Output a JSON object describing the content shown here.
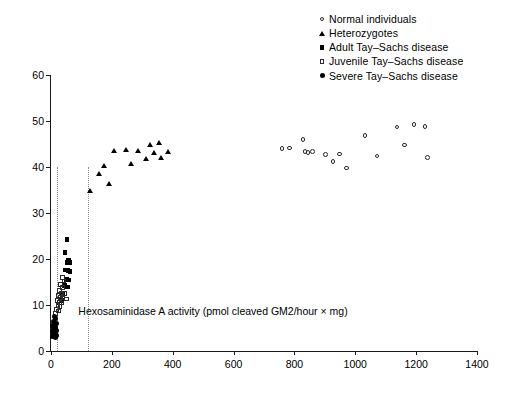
{
  "chart_data": {
    "type": "scatter",
    "title": "",
    "xlabel": "Hexosaminidase A activity (pmol cleaved GM2/hour × mg)",
    "ylabel": "Turnover (% of incorporated GM2)",
    "xlim": [
      0,
      1400
    ],
    "ylim": [
      0,
      60
    ],
    "xticks": [
      0,
      200,
      400,
      600,
      800,
      1000,
      1200,
      1400
    ],
    "yticks": [
      0,
      10,
      20,
      30,
      40,
      50,
      60
    ],
    "grid": false,
    "legend_position": "top-right",
    "reference_lines": [
      {
        "type": "vertical",
        "x": 20,
        "y_from": 0,
        "y_to": 40,
        "style": "dotted",
        "color": "#8a8a8a"
      },
      {
        "type": "vertical",
        "x": 120,
        "y_from": 0,
        "y_to": 40,
        "style": "dotted",
        "color": "#8a8a8a"
      }
    ],
    "series": [
      {
        "name": "Normal individuals",
        "marker": "open-circle",
        "marker_class": "m-open-circle",
        "point_class": "oc",
        "points": [
          [
            762,
            43.8
          ],
          [
            787,
            43.9
          ],
          [
            832,
            45.8
          ],
          [
            838,
            43.2
          ],
          [
            848,
            42.9
          ],
          [
            862,
            43.2
          ],
          [
            905,
            42.5
          ],
          [
            930,
            41.0
          ],
          [
            952,
            42.6
          ],
          [
            975,
            39.6
          ],
          [
            1035,
            46.6
          ],
          [
            1075,
            42.2
          ],
          [
            1140,
            48.5
          ],
          [
            1165,
            44.6
          ],
          [
            1196,
            49.0
          ],
          [
            1232,
            48.6
          ],
          [
            1240,
            41.8
          ]
        ]
      },
      {
        "name": "Heterozygotes",
        "marker": "filled-triangle",
        "marker_class": "m-fill-tri",
        "point_class": "ft",
        "points": [
          [
            130,
            34.8
          ],
          [
            158,
            38.5
          ],
          [
            175,
            40.3
          ],
          [
            192,
            36.2
          ],
          [
            207,
            43.5
          ],
          [
            248,
            43.6
          ],
          [
            262,
            40.6
          ],
          [
            285,
            43.4
          ],
          [
            312,
            41.7
          ],
          [
            325,
            44.8
          ],
          [
            340,
            43.1
          ],
          [
            356,
            45.2
          ],
          [
            362,
            42.0
          ],
          [
            385,
            43.3
          ]
        ]
      },
      {
        "name": "Adult Tay–Sachs disease",
        "marker": "filled-square",
        "marker_class": "m-fill-square",
        "point_class": "fs",
        "points": [
          [
            52,
            24.2
          ],
          [
            46,
            21.4
          ],
          [
            58,
            19.8
          ],
          [
            52,
            19.3
          ],
          [
            60,
            19.2
          ],
          [
            48,
            17.6
          ],
          [
            56,
            17.5
          ],
          [
            62,
            17.3
          ],
          [
            50,
            15.6
          ],
          [
            58,
            15.4
          ],
          [
            44,
            14.3
          ],
          [
            55,
            13.9
          ],
          [
            40,
            12.4
          ],
          [
            36,
            11.0
          ]
        ]
      },
      {
        "name": "Juvenile Tay–Sachs disease",
        "marker": "open-square",
        "marker_class": "m-open-square",
        "point_class": "os",
        "points": [
          [
            40,
            15.8
          ],
          [
            46,
            15.0
          ],
          [
            34,
            14.2
          ],
          [
            42,
            13.6
          ],
          [
            30,
            12.9
          ],
          [
            38,
            12.4
          ],
          [
            47,
            12.2
          ],
          [
            27,
            11.8
          ],
          [
            35,
            11.5
          ],
          [
            43,
            11.3
          ],
          [
            55,
            11.1
          ],
          [
            24,
            10.7
          ],
          [
            31,
            10.4
          ],
          [
            39,
            10.2
          ],
          [
            26,
            9.6
          ],
          [
            33,
            9.4
          ],
          [
            22,
            8.8
          ],
          [
            29,
            8.5
          ],
          [
            19,
            7.9
          ]
        ]
      },
      {
        "name": "Severe Tay–Sachs disease",
        "marker": "filled-circle",
        "marker_class": "m-fill-circle",
        "point_class": "fc",
        "points": [
          [
            10,
            7.4
          ],
          [
            15,
            7.0
          ],
          [
            8,
            6.4
          ],
          [
            13,
            6.2
          ],
          [
            18,
            6.0
          ],
          [
            6,
            5.5
          ],
          [
            11,
            5.3
          ],
          [
            16,
            5.2
          ],
          [
            9,
            4.8
          ],
          [
            14,
            4.6
          ],
          [
            19,
            4.5
          ],
          [
            5,
            4.2
          ],
          [
            10,
            4.0
          ],
          [
            15,
            3.9
          ],
          [
            7,
            3.6
          ],
          [
            12,
            3.5
          ],
          [
            17,
            3.4
          ],
          [
            4,
            3.2
          ],
          [
            9,
            3.1
          ],
          [
            14,
            3.0
          ]
        ]
      }
    ]
  }
}
